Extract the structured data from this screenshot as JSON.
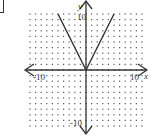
{
  "chart_data": {
    "type": "line",
    "title": "",
    "function": "y = 2|x|",
    "xlabel": "x",
    "ylabel": "y",
    "xlim": [
      -10,
      10
    ],
    "ylim": [
      -10,
      10
    ],
    "grid": "dotted",
    "tick_labels": {
      "x_left": "-10",
      "x_right": "10",
      "y_top": "10",
      "y_bottom": "-10"
    },
    "series": [
      {
        "name": "y = 2|x|",
        "x": [
          -5,
          0,
          5
        ],
        "y": [
          10,
          0,
          10
        ]
      }
    ]
  },
  "labels": {
    "x_axis": "x",
    "y_axis": "y",
    "x_min": "-10",
    "x_max": "10",
    "y_max": "10",
    "y_min": "-10"
  },
  "colors": {
    "axis": "#333333",
    "grid_dot": "#555555",
    "curve": "#333333"
  }
}
